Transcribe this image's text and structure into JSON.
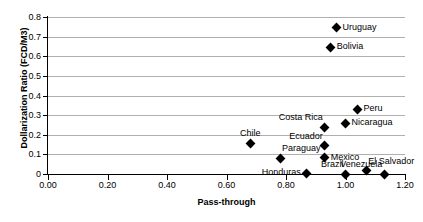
{
  "chart_data": {
    "type": "scatter",
    "title": "",
    "xlabel": "Pass-through",
    "ylabel": "Dollarization Ratio (FCD/M3)",
    "xlim": [
      0.0,
      1.2
    ],
    "ylim": [
      0.0,
      0.8
    ],
    "xticks": [
      "0.00",
      "0.20",
      "0.40",
      "0.60",
      "0.80",
      "1.00",
      "1.20"
    ],
    "xtick_values": [
      0.0,
      0.2,
      0.4,
      0.6,
      0.8,
      1.0,
      1.2
    ],
    "yticks": [
      "0",
      "0.1",
      "0.2",
      "0.3",
      "0.4",
      "0.5",
      "0.6",
      "0.7",
      "0.8"
    ],
    "ytick_values": [
      0.0,
      0.1,
      0.2,
      0.3,
      0.4,
      0.5,
      0.6,
      0.7,
      0.8
    ],
    "grid": "horizontal",
    "legend": "none",
    "marker": "diamond",
    "marker_color": "#000000",
    "points": [
      {
        "label": "Uruguay",
        "x": 0.97,
        "y": 0.745,
        "label_pos": "right"
      },
      {
        "label": "Bolivia",
        "x": 0.95,
        "y": 0.645,
        "label_pos": "right"
      },
      {
        "label": "Peru",
        "x": 1.04,
        "y": 0.33,
        "label_pos": "right"
      },
      {
        "label": "Nicaragua",
        "x": 1.0,
        "y": 0.258,
        "label_pos": "right"
      },
      {
        "label": "Costa Rica",
        "x": 0.93,
        "y": 0.238,
        "label_pos": "above-left"
      },
      {
        "label": "Ecuador",
        "x": 0.93,
        "y": 0.143,
        "label_pos": "above-left"
      },
      {
        "label": "Mexico",
        "x": 0.93,
        "y": 0.082,
        "label_pos": "right"
      },
      {
        "label": "Chile",
        "x": 0.68,
        "y": 0.155,
        "label_pos": "above"
      },
      {
        "label": "Paraguay",
        "x": 0.78,
        "y": 0.08,
        "label_pos": "above-right"
      },
      {
        "label": "Honduras",
        "x": 0.87,
        "y": 0.005,
        "label_pos": "left"
      },
      {
        "label": "Brazil",
        "x": 1.0,
        "y": 0.0,
        "label_pos": "above-left"
      },
      {
        "label": "El Salvador",
        "x": 1.07,
        "y": 0.017,
        "label_pos": "above-right"
      },
      {
        "label": "Venezuela",
        "x": 1.13,
        "y": 0.0,
        "label_pos": "above-left"
      }
    ]
  }
}
